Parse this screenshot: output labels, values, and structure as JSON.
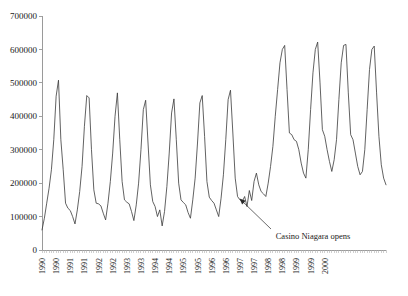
{
  "chart_data": {
    "type": "line",
    "title": "",
    "subtitle": "",
    "xlabel": "",
    "ylabel": "",
    "ylim": [
      0,
      700000
    ],
    "ytick_labels": [
      "0",
      "100000",
      "200000",
      "300000",
      "400000",
      "500000",
      "600000",
      "700000"
    ],
    "ytick_values": [
      0,
      100000,
      200000,
      300000,
      400000,
      500000,
      600000,
      700000
    ],
    "grid": false,
    "legend": "none",
    "xtick_labels": [
      "1990",
      "1990",
      "1991",
      "1991",
      "1992",
      "1992",
      "1993",
      "1993",
      "1994",
      "1994",
      "1995",
      "1995",
      "1996",
      "1996",
      "1997",
      "1997",
      "1998",
      "1998",
      "1999",
      "1999",
      "2000"
    ],
    "xtick_rotation": 90,
    "x_start": "1990-01",
    "x_end": "2000-01",
    "x_interval": "monthly",
    "annotations": [
      {
        "text": "Casino Niagara opens",
        "points_to_x": "1996-12",
        "points_to_y": 160000
      }
    ],
    "series": [
      {
        "name": "Monthly visitors",
        "color": "#3a3a3a",
        "values": [
          60000,
          95000,
          140000,
          185000,
          240000,
          330000,
          460000,
          508000,
          330000,
          240000,
          140000,
          125000,
          118000,
          100000,
          78000,
          120000,
          175000,
          250000,
          370000,
          462000,
          455000,
          300000,
          180000,
          140000,
          138000,
          132000,
          110000,
          90000,
          140000,
          205000,
          290000,
          400000,
          470000,
          330000,
          205000,
          150000,
          143000,
          138000,
          115000,
          88000,
          135000,
          200000,
          300000,
          420000,
          448000,
          320000,
          195000,
          145000,
          130000,
          100000,
          120000,
          72000,
          115000,
          190000,
          290000,
          410000,
          452000,
          330000,
          200000,
          150000,
          142000,
          135000,
          112000,
          95000,
          150000,
          215000,
          320000,
          440000,
          462000,
          340000,
          205000,
          158000,
          148000,
          140000,
          120000,
          100000,
          155000,
          225000,
          330000,
          450000,
          478000,
          350000,
          215000,
          160000,
          150000,
          145000,
          160000,
          130000,
          178000,
          148000,
          205000,
          230000,
          195000,
          175000,
          168000,
          160000,
          200000,
          250000,
          310000,
          400000,
          480000,
          560000,
          600000,
          612000,
          480000,
          350000,
          345000,
          330000,
          325000,
          300000,
          260000,
          230000,
          215000,
          300000,
          420000,
          530000,
          600000,
          622000,
          500000,
          360000,
          340000,
          300000,
          265000,
          235000,
          270000,
          330000,
          450000,
          560000,
          612000,
          615000,
          470000,
          345000,
          330000,
          290000,
          250000,
          225000,
          235000,
          300000,
          420000,
          540000,
          600000,
          610000,
          470000,
          340000,
          255000,
          215000,
          195000
        ]
      }
    ]
  },
  "annotation": {
    "casino_label": "Casino Niagara opens"
  }
}
